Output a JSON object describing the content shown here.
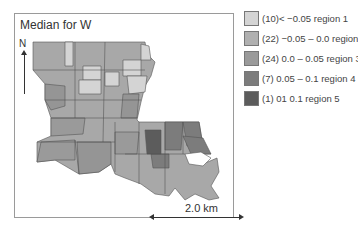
{
  "map": {
    "title": "Median for W",
    "north_label": "N",
    "scale_label": "2.0 km"
  },
  "legend": {
    "items": [
      {
        "label": "(10)< −0.05 region 1",
        "color": "#d4d4d4"
      },
      {
        "label": "(22) −0.05 – 0.0 region 2",
        "color": "#b0b0b0"
      },
      {
        "label": "(24) 0.0 – 0.05 region 3",
        "color": "#9a9a9a"
      },
      {
        "label": "(7) 0.05 – 0.1 region 4",
        "color": "#7c7c7c"
      },
      {
        "label": "(1) 01 0.1 region 5",
        "color": "#5c5c5c"
      }
    ]
  }
}
